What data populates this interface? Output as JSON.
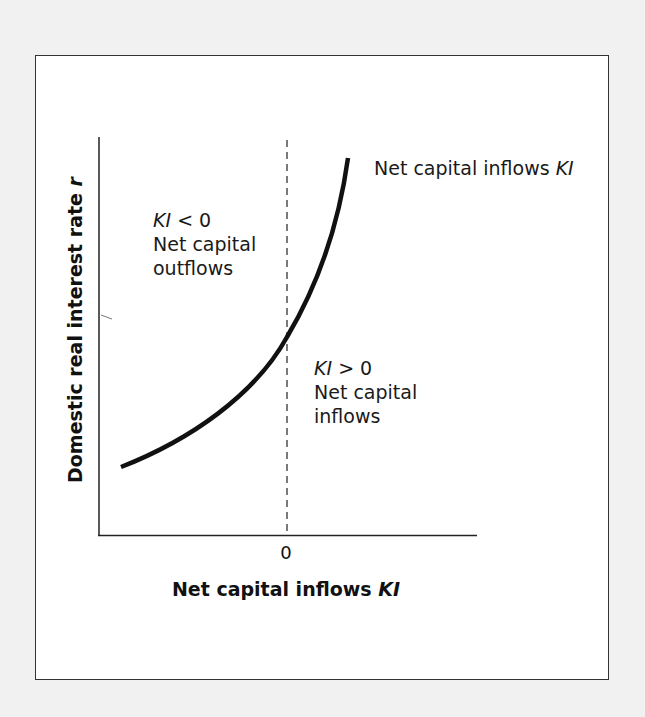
{
  "figure": {
    "y_axis_label": "Domestic real interest rate",
    "y_axis_var": "r",
    "x_axis_label": "Net capital inflows",
    "x_axis_var": "KI",
    "x_tick_zero": "0",
    "curve_label_text": "Net capital inflows",
    "curve_label_var": "KI",
    "left_region": {
      "var": "KI",
      "relation": "< 0",
      "line1": "Net capital",
      "line2": "outflows"
    },
    "right_region": {
      "var": "KI",
      "relation": "> 0",
      "line1": "Net capital",
      "line2": "inflows"
    },
    "colors": {
      "curve": "#111111",
      "axes": "#222222",
      "dashed_line": "#333333",
      "background": "#ffffff",
      "page": "#f1f1f1"
    }
  }
}
